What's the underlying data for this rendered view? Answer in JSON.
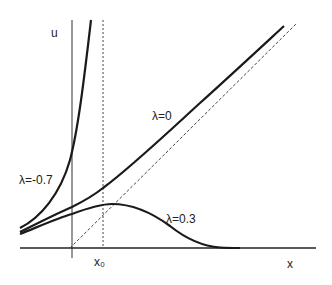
{
  "figure": {
    "axes": {
      "y_label": "u",
      "x_label": "x",
      "x0_label": "x₀"
    },
    "curves": [
      {
        "id": "lambda-neg07",
        "label": "λ=-0.7",
        "style": "solid-thick"
      },
      {
        "id": "lambda-0",
        "label": "λ=0",
        "style": "solid-thick"
      },
      {
        "id": "lambda-03",
        "label": "λ=0.3",
        "style": "solid-thick"
      }
    ],
    "guides": [
      {
        "id": "asymptote",
        "style": "dashed",
        "description": "oblique asymptote"
      },
      {
        "id": "x0-line",
        "style": "dotted",
        "description": "vertical line at x0"
      }
    ],
    "colors": {
      "ink": "#1a1a1a",
      "background": "#ffffff"
    }
  }
}
